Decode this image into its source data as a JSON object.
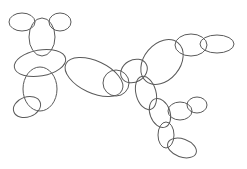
{
  "figure": {
    "width": 247,
    "height": 169,
    "background": "#ffffff",
    "stroke_color": "#5a5a5a",
    "ellipses": [
      {
        "cx": 22,
        "cy": 22,
        "rx": 13,
        "ry": 9,
        "rot": 0
      },
      {
        "cx": 60,
        "cy": 22,
        "rx": 11,
        "ry": 9,
        "rot": 0
      },
      {
        "cx": 42,
        "cy": 37,
        "rx": 13,
        "ry": 19,
        "rot": 0
      },
      {
        "cx": 40,
        "cy": 63,
        "rx": 26,
        "ry": 13,
        "rot": -10
      },
      {
        "cx": 94,
        "cy": 77,
        "rx": 31,
        "ry": 16,
        "rot": 25
      },
      {
        "cx": 40,
        "cy": 89,
        "rx": 17,
        "ry": 22,
        "rot": 0
      },
      {
        "cx": 27,
        "cy": 107,
        "rx": 14,
        "ry": 10,
        "rot": -20
      },
      {
        "cx": 116,
        "cy": 83,
        "rx": 13,
        "ry": 13,
        "rot": 0
      },
      {
        "cx": 134,
        "cy": 71,
        "rx": 14,
        "ry": 11,
        "rot": -30
      },
      {
        "cx": 162,
        "cy": 62,
        "rx": 18,
        "ry": 25,
        "rot": 40
      },
      {
        "cx": 191,
        "cy": 45,
        "rx": 16,
        "ry": 11,
        "rot": 0
      },
      {
        "cx": 217,
        "cy": 44,
        "rx": 17,
        "ry": 9,
        "rot": 0
      },
      {
        "cx": 146,
        "cy": 93,
        "rx": 10,
        "ry": 17,
        "rot": -15
      },
      {
        "cx": 160,
        "cy": 113,
        "rx": 10,
        "ry": 15,
        "rot": -20
      },
      {
        "cx": 180,
        "cy": 111,
        "rx": 12,
        "ry": 9,
        "rot": 0
      },
      {
        "cx": 197,
        "cy": 105,
        "rx": 10,
        "ry": 8,
        "rot": 0
      },
      {
        "cx": 166,
        "cy": 135,
        "rx": 8,
        "ry": 13,
        "rot": 0
      },
      {
        "cx": 182,
        "cy": 148,
        "rx": 15,
        "ry": 9,
        "rot": 20
      }
    ]
  }
}
